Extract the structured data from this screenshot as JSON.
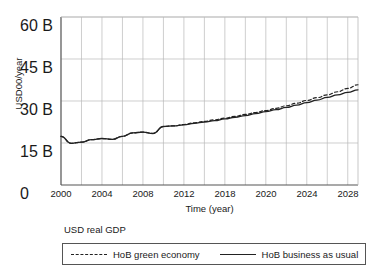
{
  "chart_data": {
    "type": "line",
    "title": "",
    "xlabel": "Time (year)",
    "ylabel": "USD00/year",
    "xlim": [
      2000,
      2029
    ],
    "ylim": [
      0,
      60
    ],
    "grid": true,
    "y_ticks": [
      0,
      15,
      30,
      45,
      60
    ],
    "y_tick_labels": [
      "0",
      "15 B",
      "30 B",
      "45 B",
      "60 B"
    ],
    "x_ticks": [
      2000,
      2004,
      2008,
      2012,
      2018,
      2020,
      2024,
      2028
    ],
    "x_tick_labels": [
      "2000",
      "2004",
      "2008",
      "2012",
      "2018",
      "2020",
      "2024",
      "2028"
    ],
    "x_gridlines": [
      2000,
      2002,
      2004,
      2006,
      2008,
      2010,
      2012,
      2014,
      2016,
      2018,
      2020,
      2022,
      2024,
      2026,
      2028
    ],
    "legend_title": "USD real GDP",
    "legend_position": "below",
    "x": [
      2000,
      2001,
      2002,
      2003,
      2004,
      2005,
      2006,
      2007,
      2008,
      2009,
      2010,
      2011,
      2012,
      2013,
      2014,
      2015,
      2016,
      2017,
      2018,
      2019,
      2020,
      2021,
      2022,
      2023,
      2024,
      2025,
      2026,
      2027,
      2028,
      2029
    ],
    "series": [
      {
        "name": "HoB green economy",
        "style": "dashed",
        "color": "#222222",
        "values": [
          17.4,
          14.9,
          15.3,
          16.2,
          16.6,
          16.3,
          17.4,
          18.6,
          18.9,
          18.4,
          20.9,
          21.1,
          21.6,
          22.2,
          22.7,
          23.3,
          23.9,
          24.5,
          25.2,
          25.9,
          26.6,
          27.4,
          28.3,
          29.2,
          30.2,
          31.2,
          32.2,
          33.3,
          34.5,
          35.8
        ]
      },
      {
        "name": "HoB business as usual",
        "style": "solid",
        "color": "#222222",
        "values": [
          17.4,
          14.9,
          15.3,
          16.2,
          16.6,
          16.3,
          17.4,
          18.6,
          18.9,
          18.4,
          20.9,
          21.1,
          21.5,
          22.0,
          22.5,
          23.0,
          23.6,
          24.2,
          24.8,
          25.5,
          26.2,
          26.9,
          27.7,
          28.5,
          29.4,
          30.3,
          31.3,
          32.2,
          33.1,
          34.0
        ]
      }
    ]
  },
  "axis": {
    "y_label": "USD00/year",
    "x_label": "Time (year)",
    "y_tick_0": "0",
    "y_tick_1": "15 B",
    "y_tick_2": "30 B",
    "y_tick_3": "45 B",
    "y_tick_4": "60 B",
    "x_tick_0": "2000",
    "x_tick_1": "2004",
    "x_tick_2": "2008",
    "x_tick_3": "2012",
    "x_tick_4": "2018",
    "x_tick_5": "2020",
    "x_tick_6": "2024",
    "x_tick_7": "2028"
  },
  "legend": {
    "title": "USD real GDP",
    "entry_green": "HoB green economy",
    "entry_bau": "HoB business as usual"
  },
  "colors": {
    "line": "#222222",
    "grid": "#b9b9b9",
    "frame": "#555555",
    "text": "#1a1a1a",
    "background": "#ffffff"
  }
}
